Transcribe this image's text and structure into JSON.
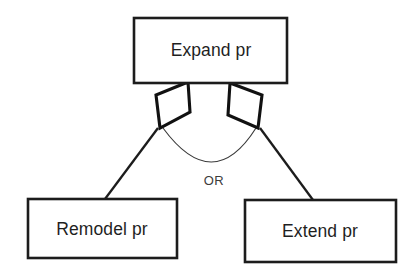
{
  "diagram": {
    "background_color": "#ffffff",
    "line_color": "#1c1c1c",
    "text_color": "#1f1f1f",
    "nodes": [
      {
        "id": "expand",
        "label": "Expand pr",
        "shape": "rectangle",
        "x": 134,
        "y": 18,
        "width": 153,
        "height": 65,
        "label_x": 211,
        "label_y": 51
      },
      {
        "id": "remodel",
        "label": "Remodel pr",
        "shape": "rectangle",
        "x": 28,
        "y": 199,
        "width": 149,
        "height": 59,
        "label_x": 102,
        "label_y": 230
      },
      {
        "id": "extend",
        "label": "Extend pr",
        "shape": "rectangle",
        "x": 245,
        "y": 200,
        "width": 151,
        "height": 62,
        "label_x": 320,
        "label_y": 232
      }
    ],
    "decisions": [
      {
        "id": "left-diamond",
        "shape": "parallelogram",
        "points": "188,82 156,95 160,128 190,112"
      },
      {
        "id": "right-diamond",
        "shape": "parallelogram",
        "points": "230,83 262,95 258,128 228,115"
      }
    ],
    "connectors": [
      {
        "id": "left-connector",
        "from": "left-diamond",
        "to": "remodel",
        "path": "M 158,128 L 105,199"
      },
      {
        "id": "right-connector",
        "from": "right-diamond",
        "to": "extend",
        "path": "M 260,128 L 313,200"
      }
    ],
    "or_arc": {
      "id": "or-arc",
      "path": "M 163,128 Q 213,196 256,128"
    },
    "or_label": {
      "text": "OR",
      "x": 214,
      "y": 182
    }
  }
}
